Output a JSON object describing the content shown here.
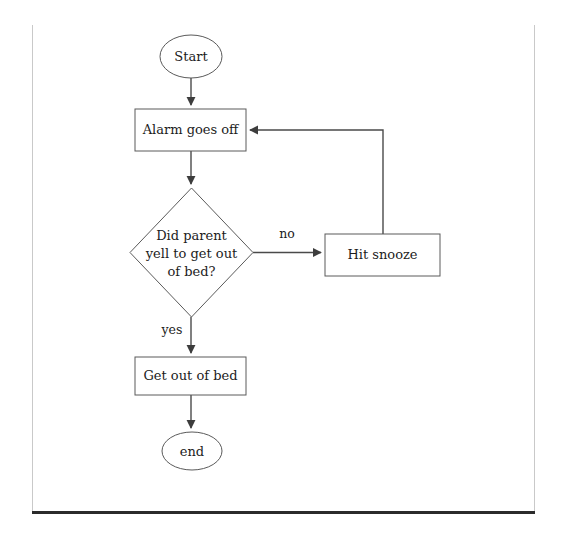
{
  "diagram": {
    "type": "flowchart",
    "nodes": [
      {
        "id": "start",
        "shape": "ellipse",
        "label": "Start",
        "cx": 191,
        "cy": 56.5,
        "rx": 31,
        "ry": 21.5
      },
      {
        "id": "alarm",
        "shape": "rectangle",
        "label": "Alarm goes off",
        "x": 135,
        "y": 109,
        "w": 111,
        "h": 42
      },
      {
        "id": "decision",
        "shape": "diamond",
        "label_line1": "Did parent",
        "label_line2": "yell to get out",
        "label_line3": "of bed?",
        "cx": 191.5,
        "cy": 252.5,
        "rx": 61.5,
        "ry": 64.5
      },
      {
        "id": "snooze",
        "shape": "rectangle",
        "label": "Hit snooze",
        "x": 325,
        "y": 234,
        "w": 115,
        "h": 42
      },
      {
        "id": "getout",
        "shape": "rectangle",
        "label": "Get out of bed",
        "x": 135,
        "y": 357,
        "w": 111,
        "h": 38
      },
      {
        "id": "end",
        "shape": "ellipse",
        "label": "end",
        "cx": 192,
        "cy": 451,
        "rx": 30,
        "ry": 19
      }
    ],
    "edges": [
      {
        "id": "start-to-alarm",
        "from": "start",
        "to": "alarm",
        "label": ""
      },
      {
        "id": "alarm-to-decision",
        "from": "alarm",
        "to": "decision",
        "label": ""
      },
      {
        "id": "decision-to-snooze",
        "from": "decision",
        "to": "snooze",
        "label": "no",
        "label_x": 287,
        "label_y": 234
      },
      {
        "id": "decision-to-getout",
        "from": "decision",
        "to": "getout",
        "label": "yes",
        "label_x": 172,
        "label_y": 330
      },
      {
        "id": "snooze-to-alarm",
        "from": "snooze",
        "to": "alarm",
        "label": ""
      },
      {
        "id": "getout-to-end",
        "from": "getout",
        "to": "end",
        "label": ""
      }
    ],
    "colors": {
      "node_stroke": "#5a5a5a",
      "edge_stroke": "#4a4a4a",
      "text": "#1c1c1c",
      "page_rule_light": "#c9c9c9",
      "page_rule_heavy": "#2b2b2b",
      "background": "#ffffff"
    }
  }
}
